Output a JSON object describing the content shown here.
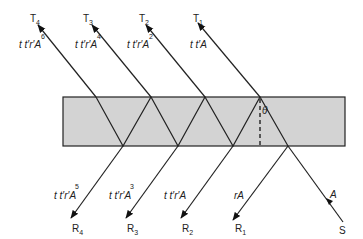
{
  "diagram": {
    "type": "multiple-beam interference in a plane-parallel plate",
    "plate": {
      "fill": "#d3d3d3",
      "stroke": "#222222"
    },
    "angle_label": "θ",
    "source": {
      "label": "S",
      "amplitude": "A"
    },
    "transmitted": [
      {
        "label": "T",
        "index": "1",
        "amp_base": "t t′A",
        "power": ""
      },
      {
        "label": "T",
        "index": "2",
        "amp_base": "t t′r′A",
        "power": "2"
      },
      {
        "label": "T",
        "index": "3",
        "amp_base": "t t′r′A",
        "power": "4"
      },
      {
        "label": "T",
        "index": "4",
        "amp_base": "t t′r′A",
        "power": "6"
      }
    ],
    "reflected": [
      {
        "label": "R",
        "index": "1",
        "amp_base": "rA",
        "power": ""
      },
      {
        "label": "R",
        "index": "2",
        "amp_base": "t t′r′A",
        "power": ""
      },
      {
        "label": "R",
        "index": "3",
        "amp_base": "t t′r′A",
        "power": "3"
      },
      {
        "label": "R",
        "index": "4",
        "amp_base": "t t′r′A",
        "power": "5"
      }
    ]
  }
}
